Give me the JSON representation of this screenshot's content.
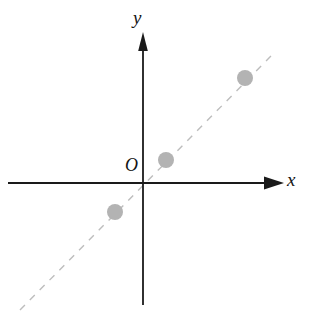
{
  "figure": {
    "width": 312,
    "height": 328,
    "background_color": "#ffffff",
    "axis_color": "#1a1a1a",
    "dashed_line_color": "#bdbdbd",
    "point_color": "#b3b3b3",
    "labels": {
      "y_axis": "y",
      "x_axis": "x",
      "origin": "O"
    }
  },
  "chart_data": {
    "type": "scatter",
    "title": "",
    "subtitle": "",
    "xlabel": "x",
    "ylabel": "y",
    "origin_label": "O",
    "grid": false,
    "legend": null,
    "xlim": [
      -3,
      4
    ],
    "ylim": [
      -3,
      4
    ],
    "axes": {
      "x_axis": {
        "orientation": "horizontal",
        "pixel_y": 183,
        "pixel_x_start": 8,
        "pixel_x_end": 282,
        "arrow_at": "end",
        "label": "x",
        "tick_labels": []
      },
      "y_axis": {
        "orientation": "vertical",
        "pixel_x": 143,
        "pixel_y_start": 305,
        "pixel_y_end": 33,
        "arrow_at": "top",
        "label": "y",
        "tick_labels": []
      },
      "origin_pixel": [
        143,
        183
      ]
    },
    "series": [
      {
        "name": "points",
        "marker": "filled-circle",
        "marker_color": "#b3b3b3",
        "marker_radius_px": 8,
        "points_pixel": [
          [
            115,
            212
          ],
          [
            166,
            160
          ],
          [
            245,
            78
          ]
        ],
        "points_data": [
          {
            "x": -0.8,
            "y": -0.8
          },
          {
            "x": 0.6,
            "y": 0.6
          },
          {
            "x": 2.8,
            "y": 2.9
          }
        ]
      },
      {
        "name": "trend-line",
        "style": "dashed",
        "color": "#bdbdbd",
        "dash_pattern": "7 7",
        "endpoints_pixel": [
          [
            20,
            310
          ],
          [
            275,
            52
          ]
        ],
        "passes_through_origin": true,
        "slope": 1,
        "intercept": 0
      }
    ]
  }
}
